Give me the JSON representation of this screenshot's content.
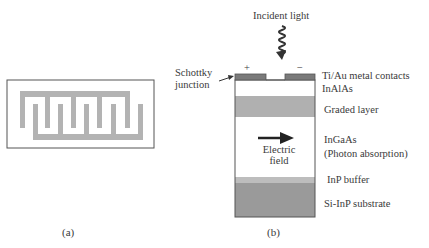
{
  "panel_a": {
    "caption": "(a)",
    "description": "Interdigitated finger electrodes (top view)",
    "colors": {
      "electrode": "#b3b3b3",
      "frame": "#555555"
    }
  },
  "panel_b": {
    "caption": "(b)",
    "incident_light_label": "Incident light",
    "plus_label": "+",
    "minus_label": "−",
    "schottky_label_line1": "Schottky",
    "schottky_label_line2": "junction",
    "electric_field_line1": "Electric",
    "electric_field_line2": "field",
    "layers": [
      {
        "name": "Ti/Au metal contacts",
        "color": "#7a7a7a"
      },
      {
        "name": "InAlAs",
        "color": "#ffffff"
      },
      {
        "name": "Graded layer",
        "color": "#b0b0b0"
      },
      {
        "name": "InGaAs",
        "sub": "(Photon absorption)",
        "color": "#ffffff"
      },
      {
        "name": "InP buffer",
        "color": "#bdbdbd"
      },
      {
        "name": "Si-InP substrate",
        "color": "#9a9a9a"
      }
    ]
  }
}
